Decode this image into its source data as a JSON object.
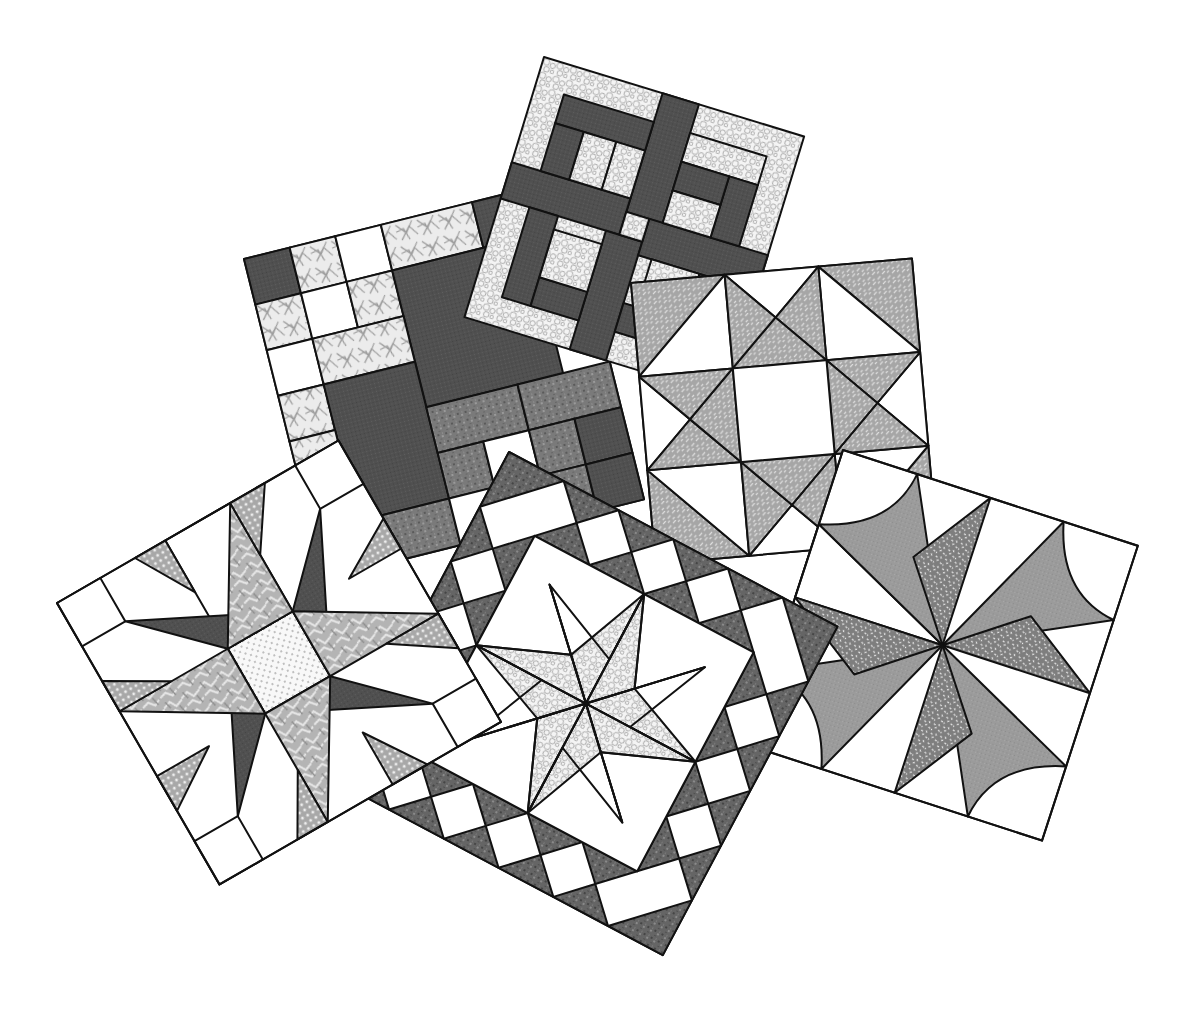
{
  "image": {
    "title": "Sampler of six pieced quilt blocks",
    "background": "#ffffff",
    "outline_color": "#111111"
  },
  "palette": {
    "dark": "#555555",
    "medium_dark": "#6e6e6e",
    "medium": "#9a9a9a",
    "light_print": "#e4e4e4",
    "white": "#ffffff",
    "basket_weave": "#a9a9a9",
    "confetti": "#8a8a8a",
    "pinwheel_solid": "#9c9c9c",
    "dotted": "#f2f2f2",
    "marble": "#b8b8b8",
    "net": "#c6c6c6"
  },
  "blocks": [
    {
      "name": "Nine-patch variation",
      "pattern": "four-patch-and-squares",
      "fabrics": [
        "dark",
        "light-scribble",
        "medium-mottled",
        "white"
      ]
    },
    {
      "name": "Woven strip block",
      "pattern": "interlocking-strips",
      "fabrics": [
        "dark",
        "light-pebble"
      ]
    },
    {
      "name": "Ohio star variation",
      "pattern": "star-with-half-square-triangles",
      "fabrics": [
        "basket-weave-gray",
        "white"
      ]
    },
    {
      "name": "Pinwheel with curved corners",
      "pattern": "eight-blade-pinwheel",
      "fabrics": [
        "solid-gray",
        "confetti-print",
        "white"
      ]
    },
    {
      "name": "LeMoyne star in border",
      "pattern": "eight-point-star-with-triangle-border",
      "fabrics": [
        "pebble-print",
        "mottled-dark",
        "white"
      ]
    },
    {
      "name": "Spinning star",
      "pattern": "twisted-star",
      "fabrics": [
        "dark",
        "marble",
        "dotted-net",
        "white"
      ]
    }
  ]
}
